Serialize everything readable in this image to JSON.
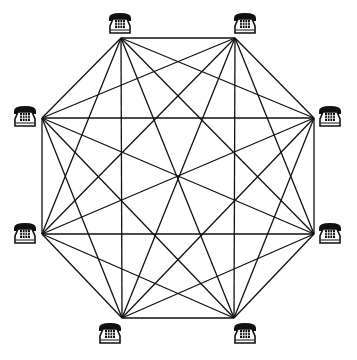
{
  "diagram": {
    "type": "complete-graph",
    "node_count": 8,
    "line_color": "#111111",
    "nodes": [
      {
        "id": "phone-top-left",
        "icon": "telephone-icon",
        "x": 121,
        "y": 38,
        "icon_x": 108,
        "icon_y": 12
      },
      {
        "id": "phone-top-right",
        "icon": "telephone-icon",
        "x": 235,
        "y": 38,
        "icon_x": 233,
        "icon_y": 12
      },
      {
        "id": "phone-right-top",
        "icon": "telephone-icon",
        "x": 314,
        "y": 118,
        "icon_x": 318,
        "icon_y": 105
      },
      {
        "id": "phone-right-bottom",
        "icon": "telephone-icon",
        "x": 314,
        "y": 234,
        "icon_x": 318,
        "icon_y": 222
      },
      {
        "id": "phone-bottom-right",
        "icon": "telephone-icon",
        "x": 234,
        "y": 318,
        "icon_x": 233,
        "icon_y": 322
      },
      {
        "id": "phone-bottom-left",
        "icon": "telephone-icon",
        "x": 122,
        "y": 318,
        "icon_x": 98,
        "icon_y": 322
      },
      {
        "id": "phone-left-bottom",
        "icon": "telephone-icon",
        "x": 42,
        "y": 234,
        "icon_x": 13,
        "icon_y": 222
      },
      {
        "id": "phone-left-top",
        "icon": "telephone-icon",
        "x": 42,
        "y": 118,
        "icon_x": 13,
        "icon_y": 105
      }
    ]
  }
}
